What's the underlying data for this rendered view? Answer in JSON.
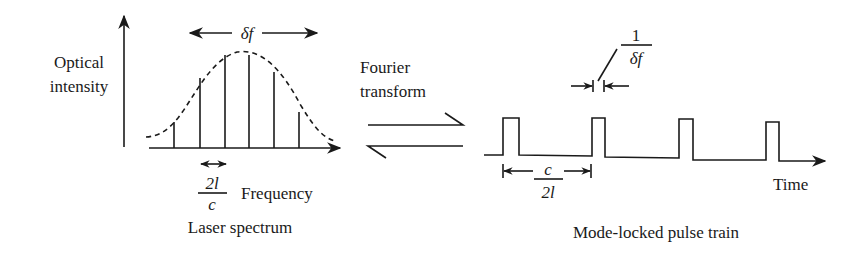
{
  "left_panel": {
    "y_axis_label_line1": "Optical",
    "y_axis_label_line2": "intensity",
    "x_axis_label": "Frequency",
    "bandwidth_label": "δf",
    "mode_spacing": {
      "numerator": "2l",
      "denominator": "c"
    },
    "caption": "Laser spectrum",
    "spectral_lines": [
      {
        "x": 174,
        "top": 122
      },
      {
        "x": 200,
        "top": 78
      },
      {
        "x": 225,
        "top": 55
      },
      {
        "x": 249,
        "top": 55
      },
      {
        "x": 274,
        "top": 72
      },
      {
        "x": 299,
        "top": 112
      }
    ]
  },
  "middle": {
    "label_line1": "Fourier",
    "label_line2": "transform"
  },
  "right_panel": {
    "pulse_width": {
      "numerator": "1",
      "denominator": "δf"
    },
    "pulse_period": {
      "numerator": "c",
      "denominator": "2l"
    },
    "x_axis_label": "Time",
    "caption": "Mode-locked pulse train"
  },
  "colors": {
    "ink": "#1a1a1a",
    "background": "#ffffff"
  }
}
